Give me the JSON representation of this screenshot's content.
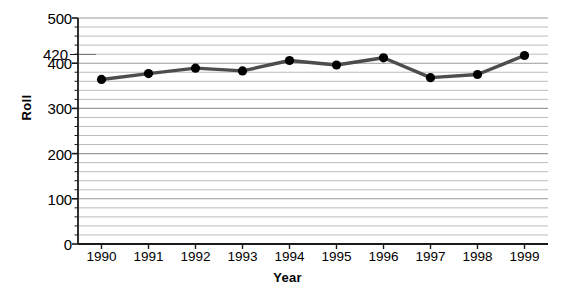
{
  "chart_data": {
    "type": "line",
    "title": "",
    "xlabel": "Year",
    "ylabel": "Roll",
    "categories": [
      1990,
      1991,
      1992,
      1993,
      1994,
      1995,
      1996,
      1997,
      1998,
      1999
    ],
    "xtick_labels": [
      "1990",
      "1991",
      "1992",
      "1993",
      "1994",
      "1995",
      "1996",
      "1997",
      "1998",
      "1999"
    ],
    "values": [
      364,
      377,
      389,
      383,
      406,
      396,
      412,
      368,
      375,
      417
    ],
    "ylim": [
      0,
      500
    ],
    "xlim": [
      1989.5,
      1999.5
    ],
    "ytick_labels": [
      "0",
      "100",
      "200",
      "300",
      "400",
      "500"
    ],
    "ytick_values": [
      0,
      100,
      200,
      300,
      400,
      500
    ],
    "minor_gridline_step": 20,
    "grid": true,
    "grid_axis": "y",
    "legend": false,
    "legend_position": "none",
    "annotations": [
      {
        "label": "420",
        "value": 420,
        "axis": "y",
        "has_leader_line": true
      }
    ],
    "series": [
      {
        "name": "Roll",
        "values": [
          364,
          377,
          389,
          383,
          406,
          396,
          412,
          368,
          375,
          417
        ],
        "line_color": "#4d4d4d",
        "marker_color": "#000000",
        "marker": "circle"
      }
    ]
  },
  "colors": {
    "line": "#4d4d4d",
    "marker": "#000000",
    "grid": "#b4b4b4",
    "axis": "#1a1a1a",
    "background": "#ffffff",
    "text": "#000000"
  },
  "caption": ""
}
